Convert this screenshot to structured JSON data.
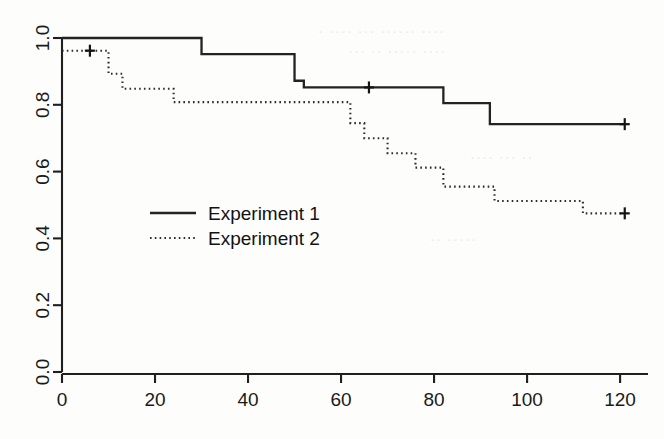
{
  "chart_data": {
    "type": "line",
    "subtype": "kaplan-meier-step",
    "title": "",
    "subtitle": "",
    "xlabel": "",
    "ylabel": "",
    "xlim": [
      0,
      126
    ],
    "ylim": [
      0.0,
      1.0
    ],
    "grid": false,
    "legend_position": "center-left",
    "x_ticks": [
      0,
      20,
      40,
      60,
      80,
      100,
      120
    ],
    "x_tick_labels": [
      "0",
      "20",
      "40",
      "60",
      "80",
      "100",
      "120"
    ],
    "y_ticks": [
      0.0,
      0.2,
      0.4,
      0.6,
      0.8,
      1.0
    ],
    "y_tick_labels": [
      "0.0",
      "0.2",
      "0.4",
      "0.6",
      "0.8",
      "1.0"
    ],
    "series": [
      {
        "name": "Experiment 1",
        "style": "solid",
        "color": "#232323",
        "x": [
          0,
          30,
          30,
          50,
          50,
          52,
          52,
          82,
          82,
          92,
          92,
          121
        ],
        "y": [
          1.0,
          1.0,
          0.952,
          0.952,
          0.872,
          0.872,
          0.852,
          0.852,
          0.805,
          0.805,
          0.742,
          0.742
        ],
        "steps": [
          {
            "time": 0,
            "survival": 1.0
          },
          {
            "time": 30,
            "survival": 0.952
          },
          {
            "time": 50,
            "survival": 0.872
          },
          {
            "time": 52,
            "survival": 0.852
          },
          {
            "time": 82,
            "survival": 0.805
          },
          {
            "time": 92,
            "survival": 0.742
          },
          {
            "time": 121,
            "survival": 0.742
          }
        ],
        "censored": [
          {
            "time": 66,
            "survival": 0.852
          },
          {
            "time": 121,
            "survival": 0.742
          }
        ]
      },
      {
        "name": "Experiment 2",
        "style": "dotted",
        "color": "#2b2b2b",
        "x": [
          0,
          6,
          10,
          10,
          13,
          13,
          24,
          24,
          62,
          62,
          65,
          65,
          70,
          70,
          76,
          76,
          82,
          82,
          93,
          93,
          112,
          112,
          121
        ],
        "y": [
          0.962,
          0.962,
          0.962,
          0.893,
          0.893,
          0.848,
          0.848,
          0.808,
          0.808,
          0.745,
          0.745,
          0.7,
          0.7,
          0.655,
          0.655,
          0.612,
          0.612,
          0.555,
          0.555,
          0.512,
          0.512,
          0.475,
          0.475
        ],
        "steps": [
          {
            "time": 0,
            "survival": 0.962
          },
          {
            "time": 10,
            "survival": 0.893
          },
          {
            "time": 13,
            "survival": 0.848
          },
          {
            "time": 24,
            "survival": 0.808
          },
          {
            "time": 62,
            "survival": 0.745
          },
          {
            "time": 65,
            "survival": 0.7
          },
          {
            "time": 70,
            "survival": 0.655
          },
          {
            "time": 76,
            "survival": 0.612
          },
          {
            "time": 82,
            "survival": 0.555
          },
          {
            "time": 93,
            "survival": 0.512
          },
          {
            "time": 112,
            "survival": 0.475
          },
          {
            "time": 121,
            "survival": 0.475
          }
        ],
        "censored": [
          {
            "time": 6,
            "survival": 0.962
          },
          {
            "time": 121,
            "survival": 0.475
          }
        ]
      }
    ],
    "legend": [
      {
        "label": "Experiment  1",
        "style": "solid"
      },
      {
        "label": "Experiment  2",
        "style": "dotted"
      }
    ]
  },
  "legend": {
    "entry_1": "Experiment  1",
    "entry_2": "Experiment  2"
  },
  "axes": {
    "x_labels": [
      "0",
      "20",
      "40",
      "60",
      "80",
      "100",
      "120"
    ],
    "y_labels": [
      "0.0",
      "0.2",
      "0.4",
      "0.6",
      "0.8",
      "1.0"
    ]
  },
  "artifacts": {
    "bleed_1": "· ···· ··· ······ ····",
    "bleed_2": "··· ·· ····· ····",
    "bleed_3": "···· ··· ··",
    "bleed_4": "·· ·····"
  }
}
